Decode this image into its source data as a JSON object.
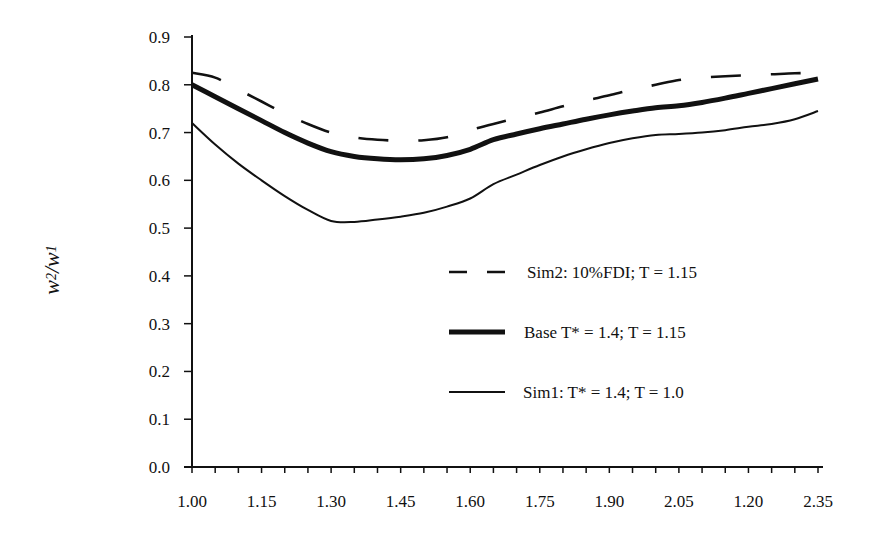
{
  "chart_data": {
    "type": "line",
    "title": "",
    "xlabel": "",
    "ylabel": "w2/w1",
    "ylabel_parts": {
      "base1": "w",
      "sub1": "2",
      "sep": " /",
      "base2": "w",
      "sub2": "1"
    },
    "x_tick_labels": [
      "1.00",
      "1.15",
      "1.30",
      "1.45",
      "1.60",
      "1.75",
      "1.90",
      "2.05",
      "1.20",
      "2.35"
    ],
    "y_tick_labels": [
      "0.0",
      "0.1",
      "0.2",
      "0.3",
      "0.4",
      "0.5",
      "0.6",
      "0.7",
      "0.8",
      "0.9"
    ],
    "ylim": [
      0.0,
      0.9
    ],
    "xlim": [
      1.0,
      2.35
    ],
    "grid": false,
    "legend_position": "center-right inside plot",
    "x": [
      1.0,
      1.05,
      1.1,
      1.15,
      1.2,
      1.25,
      1.3,
      1.35,
      1.4,
      1.45,
      1.5,
      1.55,
      1.6,
      1.65,
      1.7,
      1.75,
      1.8,
      1.85,
      1.9,
      1.95,
      2.0,
      2.05,
      2.1,
      2.15,
      2.2,
      2.25,
      2.3,
      2.35
    ],
    "series": [
      {
        "name": "Sim2: 10%FDI; T = 1.15",
        "style": "dashed",
        "values": [
          0.825,
          0.815,
          0.79,
          0.765,
          0.74,
          0.718,
          0.7,
          0.69,
          0.685,
          0.683,
          0.684,
          0.69,
          0.705,
          0.718,
          0.73,
          0.742,
          0.755,
          0.767,
          0.778,
          0.79,
          0.8,
          0.81,
          0.815,
          0.818,
          0.82,
          0.822,
          0.824,
          0.825
        ]
      },
      {
        "name": "Base T* = 1.4; T = 1.15",
        "style": "thick-solid",
        "values": [
          0.8,
          0.775,
          0.75,
          0.725,
          0.7,
          0.678,
          0.66,
          0.65,
          0.645,
          0.643,
          0.645,
          0.652,
          0.665,
          0.685,
          0.697,
          0.708,
          0.718,
          0.728,
          0.737,
          0.745,
          0.752,
          0.756,
          0.763,
          0.772,
          0.782,
          0.792,
          0.802,
          0.812
        ]
      },
      {
        "name": "Sim1: T* = 1.4; T = 1.0",
        "style": "thin-solid",
        "values": [
          0.72,
          0.675,
          0.635,
          0.6,
          0.567,
          0.538,
          0.515,
          0.513,
          0.518,
          0.524,
          0.532,
          0.545,
          0.562,
          0.592,
          0.612,
          0.632,
          0.65,
          0.665,
          0.678,
          0.688,
          0.695,
          0.697,
          0.7,
          0.705,
          0.712,
          0.718,
          0.728,
          0.745
        ]
      }
    ]
  },
  "legend": [
    {
      "label": "Sim2: 10%FDI; T = 1.15",
      "style": "dashed"
    },
    {
      "label": "Base T* = 1.4; T = 1.15",
      "style": "thick-solid"
    },
    {
      "label": "Sim1:  T* = 1.4; T = 1.0",
      "style": "thin-solid"
    }
  ]
}
